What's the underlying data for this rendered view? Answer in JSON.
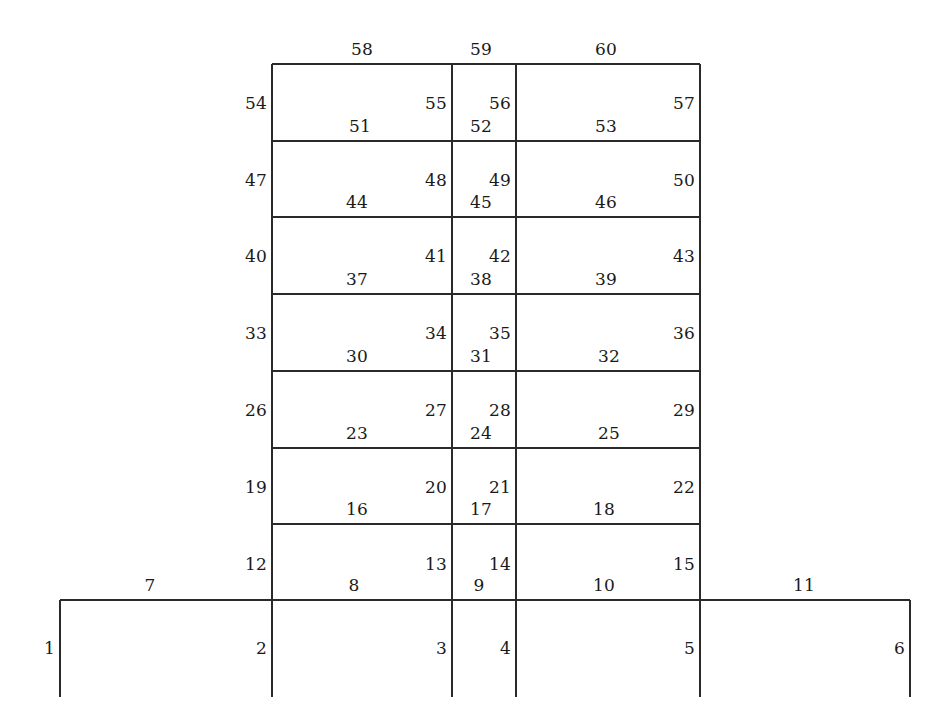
{
  "diagram": {
    "type": "multi-storey-plane-frame",
    "line_color": "#2a2a2a",
    "label_color": "#1a1a1a",
    "background_color": "#ffffff",
    "storeys": 8,
    "bays": 5,
    "total_elements": 60
  },
  "geometry": {
    "grid_x": [
      60,
      272,
      452,
      516,
      700,
      910
    ],
    "grid_y": [
      64,
      141,
      217,
      294,
      371,
      448,
      524,
      600,
      697
    ],
    "tower_left_x": 272,
    "tower_right_x": 700,
    "base_beam_y": 600,
    "roof_y": 64,
    "column_foot_y": 697
  },
  "columns": [
    {
      "id": "1",
      "x": 60,
      "y_top": 600,
      "y_bot": 697,
      "label_x": 60,
      "label_y": 648
    },
    {
      "id": "2",
      "x": 272,
      "y_top": 600,
      "y_bot": 697,
      "label_x": 272,
      "label_y": 648
    },
    {
      "id": "3",
      "x": 452,
      "y_top": 600,
      "y_bot": 697,
      "label_x": 452,
      "label_y": 648
    },
    {
      "id": "4",
      "x": 516,
      "y_top": 600,
      "y_bot": 697,
      "label_x": 516,
      "label_y": 648
    },
    {
      "id": "5",
      "x": 700,
      "y_top": 600,
      "y_bot": 697,
      "label_x": 700,
      "label_y": 648
    },
    {
      "id": "6",
      "x": 910,
      "y_top": 600,
      "y_bot": 697,
      "label_x": 910,
      "label_y": 648
    },
    {
      "id": "12",
      "x": 272,
      "y_top": 524,
      "y_bot": 600,
      "label_x": 272,
      "label_y": 564
    },
    {
      "id": "13",
      "x": 452,
      "y_top": 524,
      "y_bot": 600,
      "label_x": 452,
      "label_y": 564
    },
    {
      "id": "14",
      "x": 516,
      "y_top": 524,
      "y_bot": 600,
      "label_x": 516,
      "label_y": 564
    },
    {
      "id": "15",
      "x": 700,
      "y_top": 524,
      "y_bot": 600,
      "label_x": 700,
      "label_y": 564
    },
    {
      "id": "19",
      "x": 272,
      "y_top": 448,
      "y_bot": 524,
      "label_x": 272,
      "label_y": 487
    },
    {
      "id": "20",
      "x": 452,
      "y_top": 448,
      "y_bot": 524,
      "label_x": 452,
      "label_y": 487
    },
    {
      "id": "21",
      "x": 516,
      "y_top": 448,
      "y_bot": 524,
      "label_x": 516,
      "label_y": 487
    },
    {
      "id": "22",
      "x": 700,
      "y_top": 448,
      "y_bot": 524,
      "label_x": 700,
      "label_y": 487
    },
    {
      "id": "26",
      "x": 272,
      "y_top": 371,
      "y_bot": 448,
      "label_x": 272,
      "label_y": 410
    },
    {
      "id": "27",
      "x": 452,
      "y_top": 371,
      "y_bot": 448,
      "label_x": 452,
      "label_y": 410
    },
    {
      "id": "28",
      "x": 516,
      "y_top": 371,
      "y_bot": 448,
      "label_x": 516,
      "label_y": 410
    },
    {
      "id": "29",
      "x": 700,
      "y_top": 371,
      "y_bot": 448,
      "label_x": 700,
      "label_y": 410
    },
    {
      "id": "33",
      "x": 272,
      "y_top": 294,
      "y_bot": 371,
      "label_x": 272,
      "label_y": 333
    },
    {
      "id": "34",
      "x": 452,
      "y_top": 294,
      "y_bot": 371,
      "label_x": 452,
      "label_y": 333
    },
    {
      "id": "35",
      "x": 516,
      "y_top": 294,
      "y_bot": 371,
      "label_x": 516,
      "label_y": 333
    },
    {
      "id": "36",
      "x": 700,
      "y_top": 294,
      "y_bot": 371,
      "label_x": 700,
      "label_y": 333
    },
    {
      "id": "40",
      "x": 272,
      "y_top": 217,
      "y_bot": 294,
      "label_x": 272,
      "label_y": 256
    },
    {
      "id": "41",
      "x": 452,
      "y_top": 217,
      "y_bot": 294,
      "label_x": 452,
      "label_y": 256
    },
    {
      "id": "42",
      "x": 516,
      "y_top": 217,
      "y_bot": 294,
      "label_x": 516,
      "label_y": 256
    },
    {
      "id": "43",
      "x": 700,
      "y_top": 217,
      "y_bot": 294,
      "label_x": 700,
      "label_y": 256
    },
    {
      "id": "47",
      "x": 272,
      "y_top": 141,
      "y_bot": 217,
      "label_x": 272,
      "label_y": 180
    },
    {
      "id": "48",
      "x": 452,
      "y_top": 141,
      "y_bot": 217,
      "label_x": 452,
      "label_y": 180
    },
    {
      "id": "49",
      "x": 516,
      "y_top": 141,
      "y_bot": 217,
      "label_x": 516,
      "label_y": 180
    },
    {
      "id": "50",
      "x": 700,
      "y_top": 141,
      "y_bot": 217,
      "label_x": 700,
      "label_y": 180
    },
    {
      "id": "54",
      "x": 272,
      "y_top": 64,
      "y_bot": 141,
      "label_x": 272,
      "label_y": 103
    },
    {
      "id": "55",
      "x": 452,
      "y_top": 64,
      "y_bot": 141,
      "label_x": 452,
      "label_y": 103
    },
    {
      "id": "56",
      "x": 516,
      "y_top": 64,
      "y_bot": 141,
      "label_x": 516,
      "label_y": 103
    },
    {
      "id": "57",
      "x": 700,
      "y_top": 64,
      "y_bot": 141,
      "label_x": 700,
      "label_y": 103
    }
  ],
  "beams": [
    {
      "id": "7",
      "y": 600,
      "x1": 60,
      "x2": 272,
      "label_x": 150,
      "label_y": 598
    },
    {
      "id": "8",
      "y": 600,
      "x1": 272,
      "x2": 452,
      "label_x": 354,
      "label_y": 598
    },
    {
      "id": "9",
      "y": 600,
      "x1": 452,
      "x2": 516,
      "label_x": 479,
      "label_y": 598
    },
    {
      "id": "10",
      "y": 600,
      "x1": 516,
      "x2": 700,
      "label_x": 604,
      "label_y": 598
    },
    {
      "id": "11",
      "y": 600,
      "x1": 700,
      "x2": 910,
      "label_x": 804,
      "label_y": 598
    },
    {
      "id": "16",
      "y": 524,
      "x1": 272,
      "x2": 452,
      "label_x": 357,
      "label_y": 522
    },
    {
      "id": "17",
      "y": 524,
      "x1": 452,
      "x2": 516,
      "label_x": 481,
      "label_y": 522
    },
    {
      "id": "18",
      "y": 524,
      "x1": 516,
      "x2": 700,
      "label_x": 604,
      "label_y": 522
    },
    {
      "id": "23",
      "y": 448,
      "x1": 272,
      "x2": 452,
      "label_x": 357,
      "label_y": 446
    },
    {
      "id": "24",
      "y": 448,
      "x1": 452,
      "x2": 516,
      "label_x": 481,
      "label_y": 446
    },
    {
      "id": "25",
      "y": 448,
      "x1": 516,
      "x2": 700,
      "label_x": 609,
      "label_y": 446
    },
    {
      "id": "30",
      "y": 371,
      "x1": 272,
      "x2": 452,
      "label_x": 357,
      "label_y": 369
    },
    {
      "id": "31",
      "y": 371,
      "x1": 452,
      "x2": 516,
      "label_x": 481,
      "label_y": 369
    },
    {
      "id": "32",
      "y": 371,
      "x1": 516,
      "x2": 700,
      "label_x": 609,
      "label_y": 369
    },
    {
      "id": "37",
      "y": 294,
      "x1": 272,
      "x2": 452,
      "label_x": 357,
      "label_y": 292
    },
    {
      "id": "38",
      "y": 294,
      "x1": 452,
      "x2": 516,
      "label_x": 481,
      "label_y": 292
    },
    {
      "id": "39",
      "y": 294,
      "x1": 516,
      "x2": 700,
      "label_x": 606,
      "label_y": 292
    },
    {
      "id": "44",
      "y": 217,
      "x1": 272,
      "x2": 452,
      "label_x": 357,
      "label_y": 215
    },
    {
      "id": "45",
      "y": 217,
      "x1": 452,
      "x2": 516,
      "label_x": 481,
      "label_y": 215
    },
    {
      "id": "46",
      "y": 217,
      "x1": 516,
      "x2": 700,
      "label_x": 606,
      "label_y": 215
    },
    {
      "id": "51",
      "y": 141,
      "x1": 272,
      "x2": 452,
      "label_x": 360,
      "label_y": 139
    },
    {
      "id": "52",
      "y": 141,
      "x1": 452,
      "x2": 516,
      "label_x": 481,
      "label_y": 139
    },
    {
      "id": "53",
      "y": 141,
      "x1": 516,
      "x2": 700,
      "label_x": 606,
      "label_y": 139
    },
    {
      "id": "58",
      "y": 64,
      "x1": 272,
      "x2": 452,
      "label_x": 362,
      "label_y": 62
    },
    {
      "id": "59",
      "y": 64,
      "x1": 452,
      "x2": 516,
      "label_x": 481,
      "label_y": 62
    },
    {
      "id": "60",
      "y": 64,
      "x1": 516,
      "x2": 700,
      "label_x": 606,
      "label_y": 62
    }
  ]
}
